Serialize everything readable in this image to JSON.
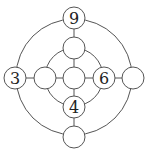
{
  "diagram": {
    "title": "",
    "colors": {
      "stroke": "#555555",
      "fill": "#ffffff",
      "text": "#222222"
    },
    "outer_ring": {
      "cx": 74,
      "cy": 77,
      "r": 58
    },
    "inner_ring": {
      "cx": 74,
      "cy": 77,
      "r": 29
    },
    "nodes": [
      {
        "id": "top",
        "cx": 74,
        "cy": 18,
        "label": "9"
      },
      {
        "id": "upper",
        "cx": 74,
        "cy": 48,
        "label": ""
      },
      {
        "id": "center",
        "cx": 74,
        "cy": 78,
        "label": ""
      },
      {
        "id": "left-inner",
        "cx": 45,
        "cy": 78,
        "label": ""
      },
      {
        "id": "right-inner",
        "cx": 104,
        "cy": 78,
        "label": "6"
      },
      {
        "id": "far-left",
        "cx": 15,
        "cy": 78,
        "label": "3"
      },
      {
        "id": "far-right",
        "cx": 133,
        "cy": 78,
        "label": ""
      },
      {
        "id": "lower",
        "cx": 74,
        "cy": 107,
        "label": "4"
      },
      {
        "id": "bottom",
        "cx": 74,
        "cy": 137,
        "label": ""
      }
    ],
    "node_radius": 11
  }
}
